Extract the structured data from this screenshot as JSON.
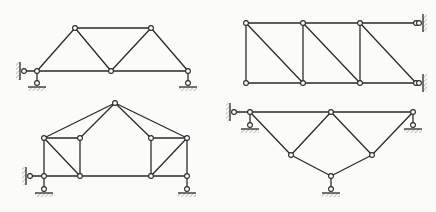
{
  "diagram": {
    "type": "planar truss structures",
    "count": 4,
    "colors": {
      "line": "#2a2a2a",
      "joint_fill": "#ffffff",
      "background": "#fbfbfa",
      "hatch": "#555555"
    },
    "figures": [
      {
        "id": "truss-1",
        "position": "top-left",
        "description": "Trapezoidal Warren-type truss with top chord and 3 bottom joints",
        "nodes": [
          [
            37,
            71
          ],
          [
            75,
            28
          ],
          [
            151,
            28
          ],
          [
            111,
            71
          ],
          [
            188,
            71
          ]
        ],
        "members": [
          [
            0,
            1
          ],
          [
            1,
            2
          ],
          [
            0,
            3
          ],
          [
            3,
            4
          ],
          [
            1,
            3
          ],
          [
            2,
            3
          ],
          [
            2,
            4
          ]
        ],
        "supports": [
          {
            "type": "horizontal-link",
            "node": 0,
            "side": "left",
            "wall_x": 20
          },
          {
            "type": "vertical-link",
            "node": 0,
            "ground_y": 87
          },
          {
            "type": "vertical-link",
            "node": 4,
            "ground_y": 87
          }
        ]
      },
      {
        "id": "truss-2",
        "position": "top-right",
        "description": "Rectangular Pratt-like truss with 3 panels, diagonals down-right, fixed by two links to right wall",
        "nodes": [
          [
            246,
            23
          ],
          [
            303,
            23
          ],
          [
            360,
            23
          ],
          [
            416,
            23
          ],
          [
            246,
            83
          ],
          [
            303,
            83
          ],
          [
            360,
            83
          ],
          [
            416,
            83
          ]
        ],
        "members": [
          [
            0,
            1
          ],
          [
            1,
            2
          ],
          [
            2,
            3
          ],
          [
            4,
            5
          ],
          [
            5,
            6
          ],
          [
            6,
            7
          ],
          [
            0,
            4
          ],
          [
            1,
            5
          ],
          [
            2,
            6
          ],
          [
            0,
            5
          ],
          [
            1,
            6
          ],
          [
            2,
            7
          ]
        ],
        "supports": [
          {
            "type": "horizontal-link",
            "node": 3,
            "side": "right",
            "wall_x": 423
          },
          {
            "type": "horizontal-link",
            "node": 7,
            "side": "right",
            "wall_x": 423
          }
        ]
      },
      {
        "id": "truss-3",
        "position": "bottom-left",
        "description": "Gable-roof truss with apex and two braced side panels",
        "nodes": [
          [
            115,
            103
          ],
          [
            44,
            138
          ],
          [
            80,
            138
          ],
          [
            44,
            176
          ],
          [
            80,
            176
          ],
          [
            151,
            138
          ],
          [
            187,
            138
          ],
          [
            151,
            176
          ],
          [
            187,
            176
          ]
        ],
        "members": [
          [
            1,
            0
          ],
          [
            0,
            6
          ],
          [
            0,
            2
          ],
          [
            0,
            5
          ],
          [
            1,
            2
          ],
          [
            5,
            6
          ],
          [
            1,
            3
          ],
          [
            2,
            4
          ],
          [
            5,
            7
          ],
          [
            6,
            8
          ],
          [
            3,
            4
          ],
          [
            4,
            7
          ],
          [
            7,
            8
          ],
          [
            1,
            4
          ],
          [
            7,
            6
          ]
        ],
        "supports": [
          {
            "type": "horizontal-link",
            "node": 3,
            "side": "left",
            "wall_x": 26
          },
          {
            "type": "vertical-link",
            "node": 3,
            "ground_y": 193
          },
          {
            "type": "vertical-link",
            "node": 8,
            "ground_y": 193
          }
        ]
      },
      {
        "id": "truss-4",
        "position": "bottom-right",
        "description": "Inverted triangular truss with top chord and lower V, supported at three points",
        "nodes": [
          [
            250,
            112
          ],
          [
            331,
            112
          ],
          [
            413,
            112
          ],
          [
            291,
            155
          ],
          [
            372,
            155
          ],
          [
            331,
            176
          ]
        ],
        "members": [
          [
            0,
            1
          ],
          [
            1,
            2
          ],
          [
            0,
            3
          ],
          [
            3,
            1
          ],
          [
            1,
            4
          ],
          [
            4,
            2
          ],
          [
            3,
            5
          ],
          [
            5,
            4
          ]
        ],
        "supports": [
          {
            "type": "horizontal-link",
            "node": 0,
            "side": "left",
            "wall_x": 230
          },
          {
            "type": "vertical-link",
            "node": 0,
            "ground_y": 129
          },
          {
            "type": "vertical-link",
            "node": 2,
            "ground_y": 129
          },
          {
            "type": "vertical-link",
            "node": 5,
            "ground_y": 193
          }
        ]
      }
    ]
  }
}
